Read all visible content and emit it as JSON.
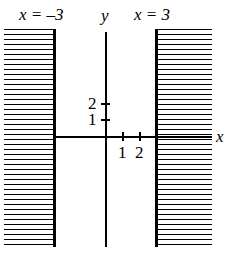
{
  "figure": {
    "title": "",
    "background_color": "#ffffff",
    "ink_color": "#000000"
  },
  "labels": {
    "left_asymptote": "x = –3",
    "right_asymptote": "x = 3",
    "y_axis": "y",
    "x_axis": "x"
  },
  "ticks": {
    "x": [
      {
        "label": "1",
        "value": 1
      },
      {
        "label": "2",
        "value": 2
      }
    ],
    "y": [
      {
        "label": "1",
        "value": 1
      },
      {
        "label": "2",
        "value": 2
      }
    ]
  },
  "chart_data": {
    "type": "line",
    "title": "",
    "xlabel": "x",
    "ylabel": "y",
    "xlim": [
      -6,
      6.3
    ],
    "ylim": [
      -6.5,
      6.3
    ],
    "grid": false,
    "legend": null,
    "series": [
      {
        "name": "vertical-asymptote-left",
        "type": "vertical-line",
        "x": -3,
        "label": "x = –3",
        "style": "solid-bold"
      },
      {
        "name": "vertical-asymptote-right",
        "type": "vertical-line",
        "x": 3,
        "label": "x = 3",
        "style": "solid-bold"
      },
      {
        "name": "shaded-region-left",
        "type": "hatched-region",
        "x_range": [
          -6,
          -3
        ],
        "hatch": "horizontal-lines"
      },
      {
        "name": "shaded-region-right",
        "type": "hatched-region",
        "x_range": [
          3,
          6.3
        ],
        "hatch": "horizontal-lines"
      }
    ],
    "xticks": [
      1,
      2
    ],
    "xticklabels": [
      "1",
      "2"
    ],
    "yticks": [
      1,
      2
    ],
    "yticklabels": [
      "1",
      "2"
    ],
    "annotations": [
      {
        "text": "x = –3",
        "x": -3,
        "y": 6.3,
        "position": "top"
      },
      {
        "text": "x = 3",
        "x": 3,
        "y": 6.3,
        "position": "top"
      },
      {
        "text": "y",
        "x": 0,
        "y": 6.3,
        "position": "axis-label"
      },
      {
        "text": "x",
        "x": 6.3,
        "y": 0,
        "position": "axis-label"
      }
    ]
  }
}
